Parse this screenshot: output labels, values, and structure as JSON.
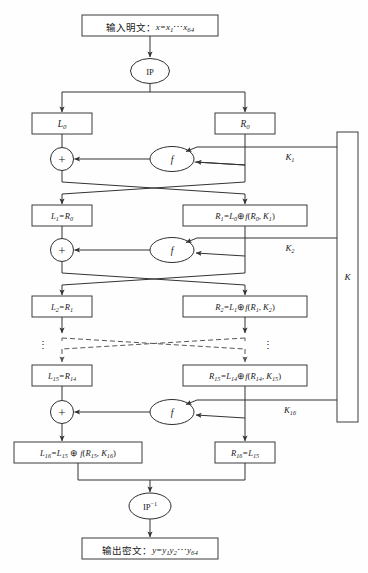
{
  "diagram": {
    "input_box": {
      "label_cn": "输入明文：",
      "formula": "x=x",
      "sub1": "1",
      "ellipsis": "…",
      "tail": "x",
      "sub2": "64",
      "full": "输入明文：x=x1…x64"
    },
    "ip_node": {
      "label": "IP"
    },
    "ip_inverse_node": {
      "label": "IP",
      "exponent": "−1"
    },
    "output_box": {
      "label_cn": "输出密文：",
      "full": "输出密文：y=y1y2…y64"
    },
    "xor_symbol": "+",
    "f_label": "f",
    "key_box_label": "K",
    "vertical_dots": "⋮",
    "rounds": [
      {
        "index": 0,
        "left_label": "L0",
        "left_main": "L",
        "left_sub": "0",
        "right_label": "R0",
        "right_main": "R",
        "right_sub": "0",
        "subkey": "K1",
        "subkey_main": "K",
        "subkey_sub": "1"
      },
      {
        "index": 1,
        "left_label": "L1=R0",
        "right_label": "R1=L0⊕f(R0, K1)",
        "subkey": "K2",
        "subkey_main": "K",
        "subkey_sub": "2"
      },
      {
        "index": 2,
        "left_label": "L2=R1",
        "right_label": "R2=L1⊕f(R1, K2)"
      },
      {
        "index": 15,
        "left_label": "L15=R14",
        "right_label": "R15=L14⊕f(R14, K15)",
        "subkey": "K16",
        "subkey_main": "K",
        "subkey_sub": "16"
      },
      {
        "index": 16,
        "left_label": "L16=L15⊕f(R15, K16)",
        "right_label": "R16=L15"
      }
    ],
    "colors": {
      "stroke": "#333333",
      "box_stroke": "#3a3a3a",
      "text": "#1a1a1a",
      "background": "#fefefe",
      "dashed_stroke": "#555555"
    }
  }
}
